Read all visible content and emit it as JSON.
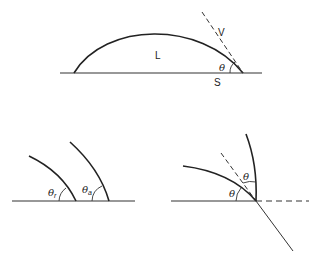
{
  "figure": {
    "top_panel": {
      "description": "Sessile liquid drop on solid surface with tangent line and contact angle",
      "labels": {
        "liquid": "L",
        "vapor": "V",
        "solid": "S",
        "angle": "θ"
      }
    },
    "bottom_left_panel": {
      "description": "Receding and advancing contact angles",
      "labels": {
        "receding_symbol": "θ",
        "receding_sub": "r",
        "advancing_symbol": "θ",
        "advancing_sub": "a"
      }
    },
    "bottom_right_panel": {
      "description": "Contact angle at a surface edge with dashed extension",
      "labels": {
        "angle_lower": "θ",
        "angle_upper": "θ"
      }
    }
  }
}
